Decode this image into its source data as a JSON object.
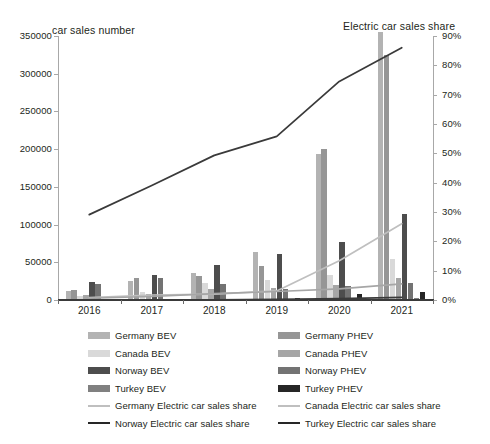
{
  "chart_data": {
    "type": "bar",
    "title": "",
    "left_axis_title": "car sales number",
    "right_axis_title": "Electric car sales share",
    "xlabel": "",
    "categories": [
      "2016",
      "2017",
      "2018",
      "2019",
      "2020",
      "2021"
    ],
    "ylim": [
      0,
      350000
    ],
    "y_ticks": [
      "0",
      "50000",
      "100000",
      "150000",
      "200000",
      "250000",
      "300000",
      "350000"
    ],
    "y2lim": [
      0,
      0.9
    ],
    "y2_ticks": [
      "0%",
      "10%",
      "20%",
      "30%",
      "40%",
      "50%",
      "60%",
      "70%",
      "80%",
      "90%"
    ],
    "grid": false,
    "legend_position": "bottom",
    "bar_series": [
      {
        "name": "Germany BEV",
        "color": "#b3b3b3",
        "values": [
          11410,
          25056,
          36062,
          63281,
          194163,
          355961
        ]
      },
      {
        "name": "Germany PHEV",
        "color": "#969696",
        "values": [
          13744,
          29436,
          31442,
          45348,
          200469,
          325449
        ]
      },
      {
        "name": "Canada BEV",
        "color": "#d9d9d9",
        "values": [
          5220,
          11125,
          23055,
          26565,
          33670,
          53918
        ]
      },
      {
        "name": "Canada PHEV",
        "color": "#a6a6a6",
        "values": [
          6142,
          8412,
          14725,
          16570,
          20385,
          28930
        ]
      },
      {
        "name": "Norway BEV",
        "color": "#4d4d4d",
        "values": [
          24222,
          33027,
          46143,
          60345,
          76789,
          113715
        ]
      },
      {
        "name": "Norway PHEV",
        "color": "#737373",
        "values": [
          20663,
          29498,
          21694,
          14935,
          19140,
          22080
        ]
      },
      {
        "name": "Turkey BEV",
        "color": "#808080",
        "values": [
          182,
          274,
          456,
          698,
          1220,
          2850
        ]
      },
      {
        "name": "Turkey PHEV",
        "color": "#262626",
        "values": [
          96,
          165,
          310,
          2050,
          8240,
          9980
        ]
      }
    ],
    "line_series": [
      {
        "name": "Germany Electric car sales share",
        "color": "#bfbfbf",
        "values": [
          0.008,
          0.017,
          0.02,
          0.031,
          0.134,
          0.26
        ]
      },
      {
        "name": "Canada Electric car sales share",
        "color": "#a6a6a6",
        "values": [
          0.006,
          0.012,
          0.022,
          0.029,
          0.038,
          0.055
        ]
      },
      {
        "name": "Norway Electric car sales share",
        "color": "#3a3a3a",
        "values": [
          0.291,
          0.39,
          0.493,
          0.558,
          0.745,
          0.86
        ]
      },
      {
        "name": "Turkey Electric car sales share",
        "color": "#3a3a3a",
        "values": [
          0.0003,
          0.0005,
          0.0008,
          0.0018,
          0.0045,
          0.009
        ]
      }
    ],
    "legend_left": [
      {
        "label": "Germany BEV",
        "color": "#b3b3b3",
        "type": "bar"
      },
      {
        "label": "Canada BEV",
        "color": "#d9d9d9",
        "type": "bar"
      },
      {
        "label": "Norway BEV",
        "color": "#4d4d4d",
        "type": "bar"
      },
      {
        "label": "Turkey BEV",
        "color": "#808080",
        "type": "bar"
      },
      {
        "label": "Germany Electric car sales share",
        "color": "#bfbfbf",
        "type": "line"
      },
      {
        "label": "Norway Electric car sales share",
        "color": "#262626",
        "type": "line"
      }
    ],
    "legend_right": [
      {
        "label": "Germany PHEV",
        "color": "#969696",
        "type": "bar"
      },
      {
        "label": "Canada PHEV",
        "color": "#a6a6a6",
        "type": "bar"
      },
      {
        "label": "Norway PHEV",
        "color": "#737373",
        "type": "bar"
      },
      {
        "label": "Turkey PHEV",
        "color": "#262626",
        "type": "bar"
      },
      {
        "label": "Canada Electric car sales share",
        "color": "#bfbfbf",
        "type": "line"
      },
      {
        "label": "Turkey Electric car sales share",
        "color": "#262626",
        "type": "line"
      }
    ]
  }
}
